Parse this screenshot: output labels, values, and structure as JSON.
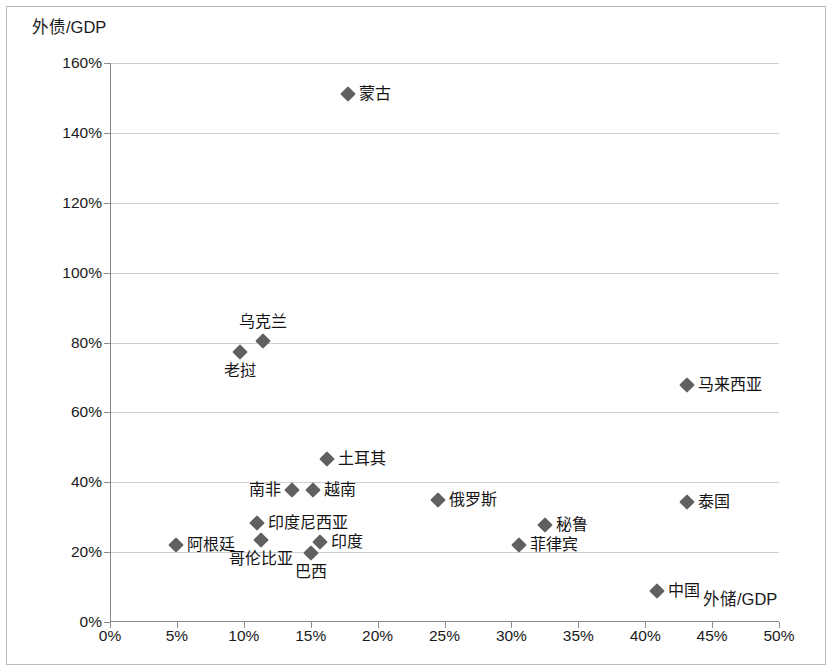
{
  "chart_data": {
    "type": "scatter",
    "title": "",
    "xlabel": "外储/GDP",
    "ylabel": "外债/GDP",
    "xlim": [
      0,
      50
    ],
    "ylim": [
      0,
      160
    ],
    "xticks": [
      "0%",
      "5%",
      "10%",
      "15%",
      "20%",
      "25%",
      "30%",
      "35%",
      "40%",
      "45%",
      "50%"
    ],
    "xtick_values": [
      0,
      5,
      10,
      15,
      20,
      25,
      30,
      35,
      40,
      45,
      50
    ],
    "yticks": [
      "0%",
      "20%",
      "40%",
      "60%",
      "80%",
      "100%",
      "120%",
      "140%",
      "160%"
    ],
    "ytick_values": [
      0,
      20,
      40,
      60,
      80,
      100,
      120,
      140,
      160
    ],
    "grid": "horizontal",
    "legend": "none",
    "marker_color": "#606060",
    "grid_color": "#cfcfcf",
    "axis_color": "#868686",
    "points": [
      {
        "label": "蒙古",
        "x": 17.8,
        "y": 151.0,
        "label_pos": "right"
      },
      {
        "label": "乌克兰",
        "x": 11.4,
        "y": 80.5,
        "label_pos": "above"
      },
      {
        "label": "老挝",
        "x": 9.7,
        "y": 77.3,
        "label_pos": "below"
      },
      {
        "label": "马来西亚",
        "x": 43.1,
        "y": 67.8,
        "label_pos": "right"
      },
      {
        "label": "土耳其",
        "x": 16.2,
        "y": 46.7,
        "label_pos": "right"
      },
      {
        "label": "南非",
        "x": 13.6,
        "y": 37.8,
        "label_pos": "left"
      },
      {
        "label": "越南",
        "x": 15.2,
        "y": 37.8,
        "label_pos": "right"
      },
      {
        "label": "俄罗斯",
        "x": 24.5,
        "y": 34.9,
        "label_pos": "right"
      },
      {
        "label": "泰国",
        "x": 43.1,
        "y": 34.4,
        "label_pos": "right"
      },
      {
        "label": "印度尼西亚",
        "x": 11.0,
        "y": 28.4,
        "label_pos": "right"
      },
      {
        "label": "秘鲁",
        "x": 32.5,
        "y": 27.9,
        "label_pos": "right"
      },
      {
        "label": "哥伦比亚",
        "x": 11.3,
        "y": 23.6,
        "label_pos": "below"
      },
      {
        "label": "印度",
        "x": 15.7,
        "y": 22.8,
        "label_pos": "right"
      },
      {
        "label": "阿根廷",
        "x": 4.9,
        "y": 22.0,
        "label_pos": "right"
      },
      {
        "label": "菲律宾",
        "x": 30.6,
        "y": 21.9,
        "label_pos": "right"
      },
      {
        "label": "巴西",
        "x": 15.0,
        "y": 19.8,
        "label_pos": "below"
      },
      {
        "label": "中国",
        "x": 40.9,
        "y": 9.0,
        "label_pos": "right"
      }
    ]
  }
}
